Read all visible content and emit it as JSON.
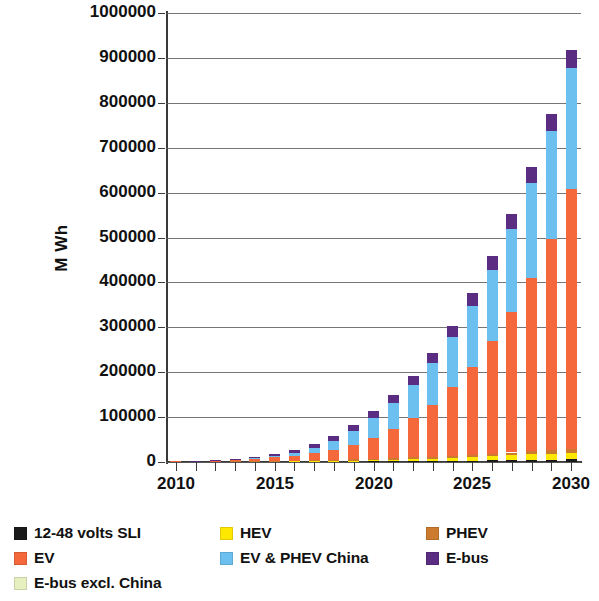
{
  "chart_data": {
    "type": "bar",
    "title": "",
    "subtitle": "",
    "xlabel": "",
    "ylabel": "M Wh",
    "stacked": true,
    "grid": true,
    "legend_position": "bottom",
    "ylim": [
      0,
      1000000
    ],
    "ytick_step": 100000,
    "ytick_labels": [
      "0",
      "100000",
      "200000",
      "300000",
      "400000",
      "500000",
      "600000",
      "700000",
      "800000",
      "900000",
      "1000000"
    ],
    "xlim": [
      2010,
      2030
    ],
    "xtick_labels": [
      "2010",
      "2015",
      "2020",
      "2025",
      "2030"
    ],
    "categories": [
      "2010",
      "2011",
      "2012",
      "2013",
      "2014",
      "2015",
      "2016",
      "2017",
      "2018",
      "2019",
      "2020",
      "2021",
      "2022",
      "2023",
      "2024",
      "2025",
      "2026",
      "2027",
      "2028",
      "2029",
      "2030"
    ],
    "series": [
      {
        "name": "12-48 volts SLI",
        "color": "#1a1a1a",
        "values": [
          300,
          350,
          400,
          450,
          500,
          600,
          700,
          800,
          900,
          1000,
          1200,
          1500,
          1800,
          2200,
          2600,
          3000,
          3600,
          4200,
          4800,
          5400,
          6000
        ]
      },
      {
        "name": "HEV",
        "color": "#ffe800",
        "values": [
          200,
          250,
          350,
          500,
          700,
          900,
          1200,
          1500,
          1900,
          2300,
          2900,
          3600,
          4400,
          5300,
          6400,
          7600,
          9000,
          10500,
          12000,
          13500,
          15000
        ]
      },
      {
        "name": "PHEV",
        "color": "#cc7a2e",
        "values": [
          100,
          150,
          250,
          400,
          600,
          900,
          1200,
          1600,
          2000,
          2400,
          2900,
          3400,
          3900,
          4400,
          5000,
          5500,
          6000,
          6500,
          7000,
          7500,
          8000
        ]
      },
      {
        "name": "EV",
        "color": "#f4683c",
        "values": [
          200,
          600,
          1800,
          3600,
          5500,
          8000,
          11000,
          16000,
          23000,
          33000,
          47000,
          64000,
          87000,
          116000,
          152000,
          196000,
          250000,
          312000,
          385000,
          470000,
          580000
        ]
      },
      {
        "name": "EV & PHEV China",
        "color": "#6cc0ef",
        "values": [
          0,
          0,
          200,
          800,
          2000,
          4000,
          7000,
          12000,
          20000,
          31000,
          44000,
          58000,
          74000,
          92000,
          112000,
          135000,
          160000,
          185000,
          212000,
          240000,
          268000
        ]
      },
      {
        "name": "E-bus",
        "color": "#5b2d82",
        "values": [
          0,
          100,
          400,
          1200,
          2500,
          4200,
          6200,
          8500,
          11000,
          13500,
          16000,
          18500,
          21000,
          23500,
          26000,
          28500,
          31000,
          33500,
          36000,
          38500,
          41000
        ]
      },
      {
        "name": "E-bus excl. China",
        "color": "#e6efc0",
        "values": [
          0,
          0,
          0,
          0,
          0,
          0,
          0,
          0,
          0,
          0,
          0,
          0,
          0,
          0,
          0,
          0,
          0,
          0,
          0,
          0,
          0
        ]
      }
    ],
    "totals": [
      800,
      1450,
      3400,
      6950,
      11800,
      17600,
      27300,
      40400,
      58800,
      83200,
      114000,
      149000,
      192100,
      243400,
      304000,
      375600,
      459600,
      551700,
      656800,
      774900,
      918000
    ],
    "annotations": []
  },
  "legend": {
    "entries": [
      {
        "label": "12-48 volts SLI",
        "color": "#1a1a1a"
      },
      {
        "label": "HEV",
        "color": "#ffe800"
      },
      {
        "label": "PHEV",
        "color": "#cc7a2e"
      },
      {
        "label": "EV",
        "color": "#f4683c"
      },
      {
        "label": "EV & PHEV China",
        "color": "#6cc0ef"
      },
      {
        "label": "E-bus",
        "color": "#5b2d82"
      },
      {
        "label": "E-bus excl. China",
        "color": "#e6efc0"
      }
    ]
  },
  "axes": {
    "y_title": "M Wh"
  }
}
